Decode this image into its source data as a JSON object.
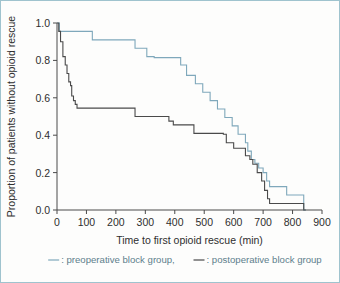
{
  "figure": {
    "frame_color": "#9fc3ce",
    "background": "#fdfdfc"
  },
  "chart_data": {
    "type": "line",
    "subtype": "kaplan-meier-step",
    "title": "",
    "xlabel": "Time to first opioid rescue  (min)",
    "ylabel": "Proportion of patients without opioid rescue",
    "xlim": [
      0,
      900
    ],
    "ylim": [
      0.0,
      1.0
    ],
    "xticks": [
      0,
      100,
      200,
      300,
      400,
      500,
      600,
      700,
      800,
      900
    ],
    "xtick_labels": [
      "0",
      "100",
      "200",
      "300",
      "400",
      "500",
      "600",
      "700",
      "800",
      "900"
    ],
    "yticks": [
      0.0,
      0.2,
      0.4,
      0.6,
      0.8,
      1.0
    ],
    "ytick_labels": [
      "0.0",
      "0.2",
      "0.4",
      "0.6",
      "0.8",
      "1.0"
    ],
    "grid": false,
    "legend_position": "below-axes",
    "series": [
      {
        "name": "preoperative block group",
        "color": "#7fa8bb",
        "x": [
          0,
          8,
          8,
          120,
          120,
          265,
          265,
          305,
          305,
          330,
          330,
          420,
          420,
          440,
          440,
          470,
          470,
          495,
          495,
          520,
          520,
          545,
          545,
          570,
          570,
          595,
          595,
          615,
          615,
          640,
          640,
          648,
          648,
          660,
          660,
          672,
          672,
          685,
          685,
          700,
          700,
          712,
          712,
          722,
          722,
          780,
          780,
          838,
          838,
          845
        ],
        "y": [
          1.0,
          1.0,
          0.955,
          0.955,
          0.91,
          0.91,
          0.865,
          0.865,
          0.82,
          0.82,
          0.815,
          0.815,
          0.775,
          0.775,
          0.72,
          0.72,
          0.675,
          0.675,
          0.63,
          0.63,
          0.585,
          0.585,
          0.54,
          0.54,
          0.495,
          0.495,
          0.45,
          0.45,
          0.405,
          0.405,
          0.36,
          0.36,
          0.315,
          0.315,
          0.27,
          0.27,
          0.25,
          0.25,
          0.225,
          0.225,
          0.2,
          0.2,
          0.155,
          0.155,
          0.125,
          0.125,
          0.08,
          0.08,
          0.0,
          0.0
        ],
        "n_steps": 22
      },
      {
        "name": "postoperative block group",
        "color": "#4a4a4a",
        "x": [
          0,
          6,
          6,
          12,
          12,
          20,
          20,
          28,
          28,
          34,
          34,
          40,
          40,
          46,
          46,
          50,
          50,
          56,
          56,
          62,
          62,
          68,
          68,
          265,
          265,
          380,
          380,
          395,
          395,
          465,
          465,
          565,
          565,
          575,
          575,
          600,
          600,
          640,
          640,
          655,
          655,
          665,
          665,
          680,
          680,
          695,
          695,
          705,
          705,
          715,
          715,
          722,
          722,
          838,
          838,
          845
        ],
        "y": [
          1.0,
          1.0,
          0.955,
          0.955,
          0.9,
          0.9,
          0.82,
          0.82,
          0.775,
          0.775,
          0.73,
          0.73,
          0.685,
          0.685,
          0.665,
          0.665,
          0.61,
          0.61,
          0.585,
          0.585,
          0.565,
          0.565,
          0.545,
          0.545,
          0.5,
          0.5,
          0.475,
          0.475,
          0.455,
          0.455,
          0.41,
          0.41,
          0.405,
          0.405,
          0.36,
          0.36,
          0.33,
          0.33,
          0.29,
          0.29,
          0.27,
          0.27,
          0.245,
          0.245,
          0.2,
          0.2,
          0.155,
          0.155,
          0.105,
          0.105,
          0.06,
          0.06,
          0.035,
          0.035,
          0.0,
          0.0
        ],
        "n_steps": 27
      }
    ]
  },
  "legend": {
    "entries": [
      {
        "marker": "line-dash",
        "separator": ":",
        "label": "preoperative block group,",
        "color": "#7fa8bb"
      },
      {
        "marker": "line-dash",
        "separator": ":",
        "label": "postoperative block group",
        "color": "#4a4a4a"
      }
    ]
  }
}
